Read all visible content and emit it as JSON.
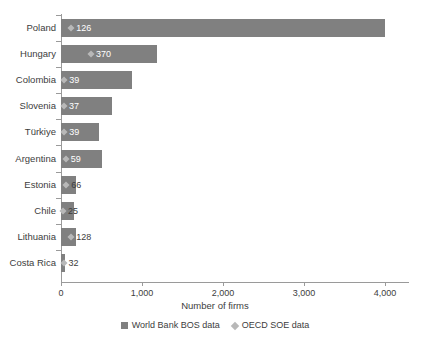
{
  "chart_data": {
    "type": "bar",
    "orientation": "horizontal",
    "title": "",
    "xlabel": "Number of firms",
    "ylabel": "",
    "xlim": [
      0,
      4400
    ],
    "grid": false,
    "legend_position": "bottom",
    "categories": [
      "Poland",
      "Hungary",
      "Colombia",
      "Slovenia",
      "Türkiye",
      "Argentina",
      "Estonia",
      "Chile",
      "Lithuania",
      "Costa Rica"
    ],
    "xticks": [
      0,
      1000,
      2000,
      3000,
      4000
    ],
    "xtick_labels": [
      "0",
      "1,000",
      "2,000",
      "3,000",
      "4,000"
    ],
    "series": [
      {
        "name": "World Bank BOS data",
        "marker": "square",
        "color": "#808080",
        "values": [
          4000,
          1190,
          880,
          630,
          470,
          510,
          190,
          160,
          190,
          50
        ]
      },
      {
        "name": "OECD SOE data",
        "marker": "diamond",
        "color": "#b8b8b8",
        "values": [
          126,
          370,
          39,
          37,
          39,
          59,
          66,
          25,
          128,
          32
        ],
        "labels": [
          "126",
          "370",
          "39",
          "37",
          "39",
          "59",
          "66",
          "25",
          "128",
          "32"
        ]
      }
    ]
  },
  "legend": {
    "items": [
      {
        "label": "World Bank BOS data",
        "marker": "square"
      },
      {
        "label": "OECD SOE data",
        "marker": "diamond"
      }
    ]
  },
  "colors": {
    "bar": "#808080",
    "diamond": "#b8b8b8",
    "axis": "#9a9a9a",
    "text": "#3d3d3d",
    "label_on_bar": "#ffffff",
    "background": "#ffffff"
  }
}
